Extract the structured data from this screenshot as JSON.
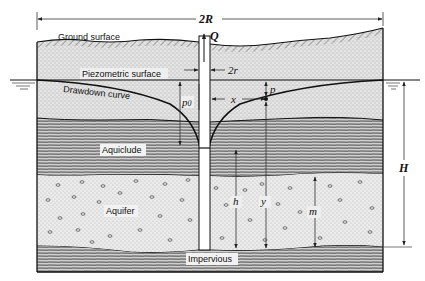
{
  "diagram": {
    "type": "confined aquifer well drawdown cross-section",
    "labels": {
      "ground_surface": "Ground surface",
      "piezometric_surface": "Piezometric surface",
      "drawdown_curve": "Drawdown curve",
      "aquiclude": "Aquiclude",
      "aquifer": "Aquifer",
      "impervious": "Impervious"
    },
    "symbols": {
      "diameter_influence": "2R",
      "discharge": "Q",
      "well_diameter": "2r",
      "initial_pressure_head": "p0",
      "pressure_drop": "p",
      "radial_distance": "x",
      "head_at_well": "h",
      "head_at_x": "y",
      "aquifer_thickness": "m",
      "static_head": "H"
    },
    "layers": [
      {
        "name": "Ground surface / overburden",
        "pattern": "stipple"
      },
      {
        "name": "Overburden below piezometric surface",
        "pattern": "stipple"
      },
      {
        "name": "Aquiclude",
        "pattern": "horizontal hatching"
      },
      {
        "name": "Aquifer",
        "pattern": "stipple with pebbles"
      },
      {
        "name": "Impervious",
        "pattern": "horizontal hatching"
      }
    ]
  }
}
